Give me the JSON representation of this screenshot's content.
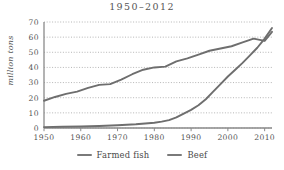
{
  "chart_data": {
    "type": "line",
    "title": "1950–2012",
    "xlabel": "",
    "ylabel": "million tons",
    "xlim": [
      1950,
      2012
    ],
    "ylim": [
      0,
      70
    ],
    "xticks": [
      1950,
      1960,
      1970,
      1980,
      1990,
      2000,
      2010
    ],
    "yticks": [
      0,
      10,
      20,
      30,
      40,
      50,
      60,
      70
    ],
    "grid": "horizontal-dotted",
    "legend_position": "bottom-center",
    "series": [
      {
        "name": "Farmed fish",
        "color": "#6e6e6e",
        "x": [
          1950,
          1955,
          1960,
          1965,
          1970,
          1975,
          1980,
          1982,
          1984,
          1986,
          1988,
          1990,
          1992,
          1994,
          1996,
          1998,
          2000,
          2002,
          2004,
          2006,
          2008,
          2010,
          2012
        ],
        "values": [
          0.6,
          0.8,
          1.0,
          1.3,
          1.8,
          2.5,
          3.5,
          4.2,
          5.2,
          7.0,
          9.5,
          12.0,
          15.0,
          19.0,
          24.0,
          29.0,
          34.0,
          38.5,
          43.0,
          48.0,
          53.0,
          59.0,
          66.0
        ]
      },
      {
        "name": "Beef",
        "color": "#6e6e6e",
        "x": [
          1950,
          1953,
          1956,
          1959,
          1962,
          1965,
          1968,
          1971,
          1974,
          1977,
          1980,
          1983,
          1986,
          1989,
          1992,
          1995,
          1998,
          2001,
          2004,
          2007,
          2010,
          2012
        ],
        "values": [
          18.0,
          20.5,
          22.5,
          24.0,
          26.5,
          28.5,
          29.0,
          32.0,
          35.5,
          38.5,
          40.0,
          40.5,
          44.0,
          46.0,
          48.5,
          51.0,
          52.5,
          54.0,
          56.5,
          59.0,
          57.5,
          63.5
        ]
      }
    ]
  },
  "legend": {
    "items": [
      {
        "label": "Farmed fish"
      },
      {
        "label": "Beef"
      }
    ]
  }
}
